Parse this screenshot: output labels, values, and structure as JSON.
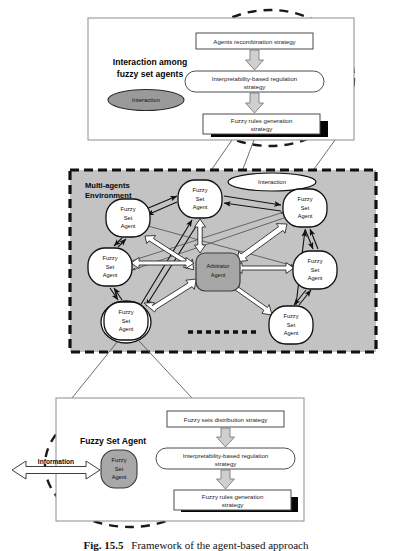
{
  "figure": {
    "caption_label": "Fig. 15.5",
    "caption_text": "Framework of the agent-based approach"
  },
  "top_panel": {
    "heading_line1": "Interaction among",
    "heading_line2": "fuzzy set agents",
    "badge_label": "Interaction",
    "flow": [
      {
        "id": "agents-recombination",
        "shape": "rect",
        "line1": "Agents recombination strategy",
        "line2": ""
      },
      {
        "id": "interpretability-regulation",
        "shape": "rounded",
        "line1": "Interpretability-based regulation",
        "line2": "strategy"
      },
      {
        "id": "fuzzy-rules-generation",
        "shape": "rect-shadow",
        "line1": "Fuzzy rules generation",
        "line2": "strategy"
      }
    ]
  },
  "environment": {
    "title_line1": "Multi-agents",
    "title_line2": "Environment",
    "interaction_label": "Interaction",
    "arbitrator": {
      "line1": "Arbitrator",
      "line2": "Agent"
    },
    "agent_label": {
      "line1": "Fuzzy",
      "line2": "Set",
      "line3": "Agent"
    },
    "agents": [
      {
        "id": "agent-top",
        "cx": 200,
        "cy": 199,
        "rx": 23,
        "ry": 20
      },
      {
        "id": "agent-upper-left",
        "cx": 128,
        "cy": 218,
        "rx": 22,
        "ry": 20
      },
      {
        "id": "agent-left",
        "cx": 110,
        "cy": 267,
        "rx": 23,
        "ry": 20
      },
      {
        "id": "agent-lower-left",
        "cx": 124,
        "cy": 320,
        "rx": 23,
        "ry": 20
      },
      {
        "id": "agent-upper-right",
        "cx": 305,
        "cy": 208,
        "rx": 23,
        "ry": 20
      },
      {
        "id": "agent-right",
        "cx": 315,
        "cy": 270,
        "rx": 23,
        "ry": 20
      },
      {
        "id": "agent-lower-right",
        "cx": 291,
        "cy": 325,
        "rx": 23,
        "ry": 20
      }
    ],
    "ellipsis_marker": "dashed-line"
  },
  "bottom_panel": {
    "heading": "Fuzzy Set Agent",
    "io_label": "Information",
    "node_label": {
      "line1": "Fuzzy",
      "line2": "Set",
      "line3": "Agent"
    },
    "flow": [
      {
        "id": "fuzzy-sets-distribution",
        "shape": "rect",
        "line1": "Fuzzy sets distribution strategy",
        "line2": ""
      },
      {
        "id": "interpretability-regulation",
        "shape": "rounded",
        "line1": "Interpretability-based regulation",
        "line2": "strategy"
      },
      {
        "id": "fuzzy-rules-generation",
        "shape": "rect-shadow",
        "line1": "Fuzzy rules generation",
        "line2": "strategy"
      }
    ]
  },
  "colors": {
    "environment_fill": "#c3c3c3",
    "arbitrator_fill": "#a6a6a6",
    "badge_fill": "#9a9a9a",
    "block_arrow_fill": "#cfcfcf",
    "shadow": "#050505",
    "panel_stroke": "#8d8d8d"
  }
}
